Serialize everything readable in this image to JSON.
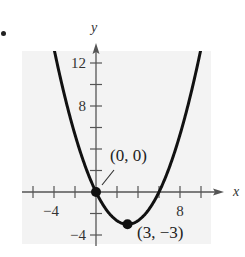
{
  "bullet": "•",
  "chart_data": {
    "type": "line",
    "title": "",
    "xlabel": "x",
    "ylabel": "y",
    "function": "y = (1/3)x^2 - 2x",
    "xlim": [
      -7,
      12
    ],
    "ylim": [
      -5,
      13.5
    ],
    "x_ticks": [
      -6,
      -4,
      -2,
      2,
      4,
      6,
      8,
      10
    ],
    "y_ticks": [
      -4,
      -2,
      2,
      4,
      6,
      8,
      10,
      12
    ],
    "x_tick_labels": [
      {
        "value": -4,
        "label": "−4"
      },
      {
        "value": 8,
        "label": "8"
      }
    ],
    "y_tick_labels": [
      {
        "value": 12,
        "label": "12"
      },
      {
        "value": 8,
        "label": "8"
      },
      {
        "value": -4,
        "label": "−4"
      }
    ],
    "grid": false,
    "background": "#f3f3f3",
    "series": [
      {
        "name": "parabola",
        "x": [
          -4,
          -3,
          -2,
          -1,
          0,
          1,
          2,
          3,
          4,
          5,
          6,
          7,
          8,
          9,
          10
        ],
        "y": [
          13.33,
          9,
          5.33,
          2.33,
          0,
          -1.67,
          -2.67,
          -3,
          -2.67,
          -1.67,
          0,
          2.33,
          5.33,
          9,
          13.33
        ]
      }
    ],
    "points": [
      {
        "x": 0,
        "y": 0,
        "label": "(0, 0)"
      },
      {
        "x": 3,
        "y": -3,
        "label": "(3, −3)"
      }
    ]
  }
}
